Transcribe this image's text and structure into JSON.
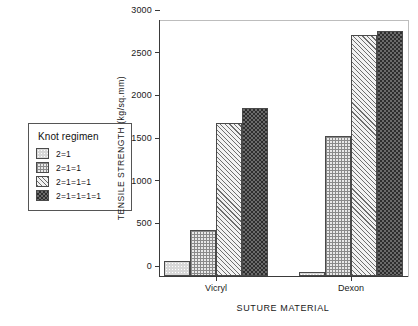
{
  "legend": {
    "title": "Knot regimen",
    "entries": [
      {
        "label": "2=1",
        "pattern": "light-dots"
      },
      {
        "label": "2=1=1",
        "pattern": "grid-crosshatch"
      },
      {
        "label": "2=1=1=1",
        "pattern": "diagonal-hatch"
      },
      {
        "label": "2=1=1=1=1",
        "pattern": "dark-checker"
      }
    ]
  },
  "chart_data": {
    "type": "bar",
    "title": "",
    "xlabel": "SUTURE MATERIAL",
    "ylabel": "TENSILE STRENGTH (kg/sq.mm)",
    "categories": [
      "Vicryl",
      "Dexon"
    ],
    "series": [
      {
        "name": "2=1",
        "values": [
          175,
          50
        ]
      },
      {
        "name": "2=1=1",
        "values": [
          540,
          1640
        ]
      },
      {
        "name": "2=1=1=1",
        "values": [
          1795,
          2830
        ]
      },
      {
        "name": "2=1=1=1=1",
        "values": [
          1970,
          2875
        ]
      }
    ],
    "ylim": [
      0,
      3000
    ],
    "ytick_values": [
      0,
      500,
      1000,
      1500,
      2000,
      2500,
      3000
    ],
    "ytick_labels": [
      "0",
      "500",
      "1000",
      "1500",
      "2000",
      "2500",
      "3000"
    ],
    "grid": false,
    "legend_position": "outside-left"
  },
  "colors": {
    "axis": "#3a3a3a",
    "text": "#1a1a1a",
    "frame": "#bdbdbd",
    "bar_outline": "#4a4a4a"
  }
}
